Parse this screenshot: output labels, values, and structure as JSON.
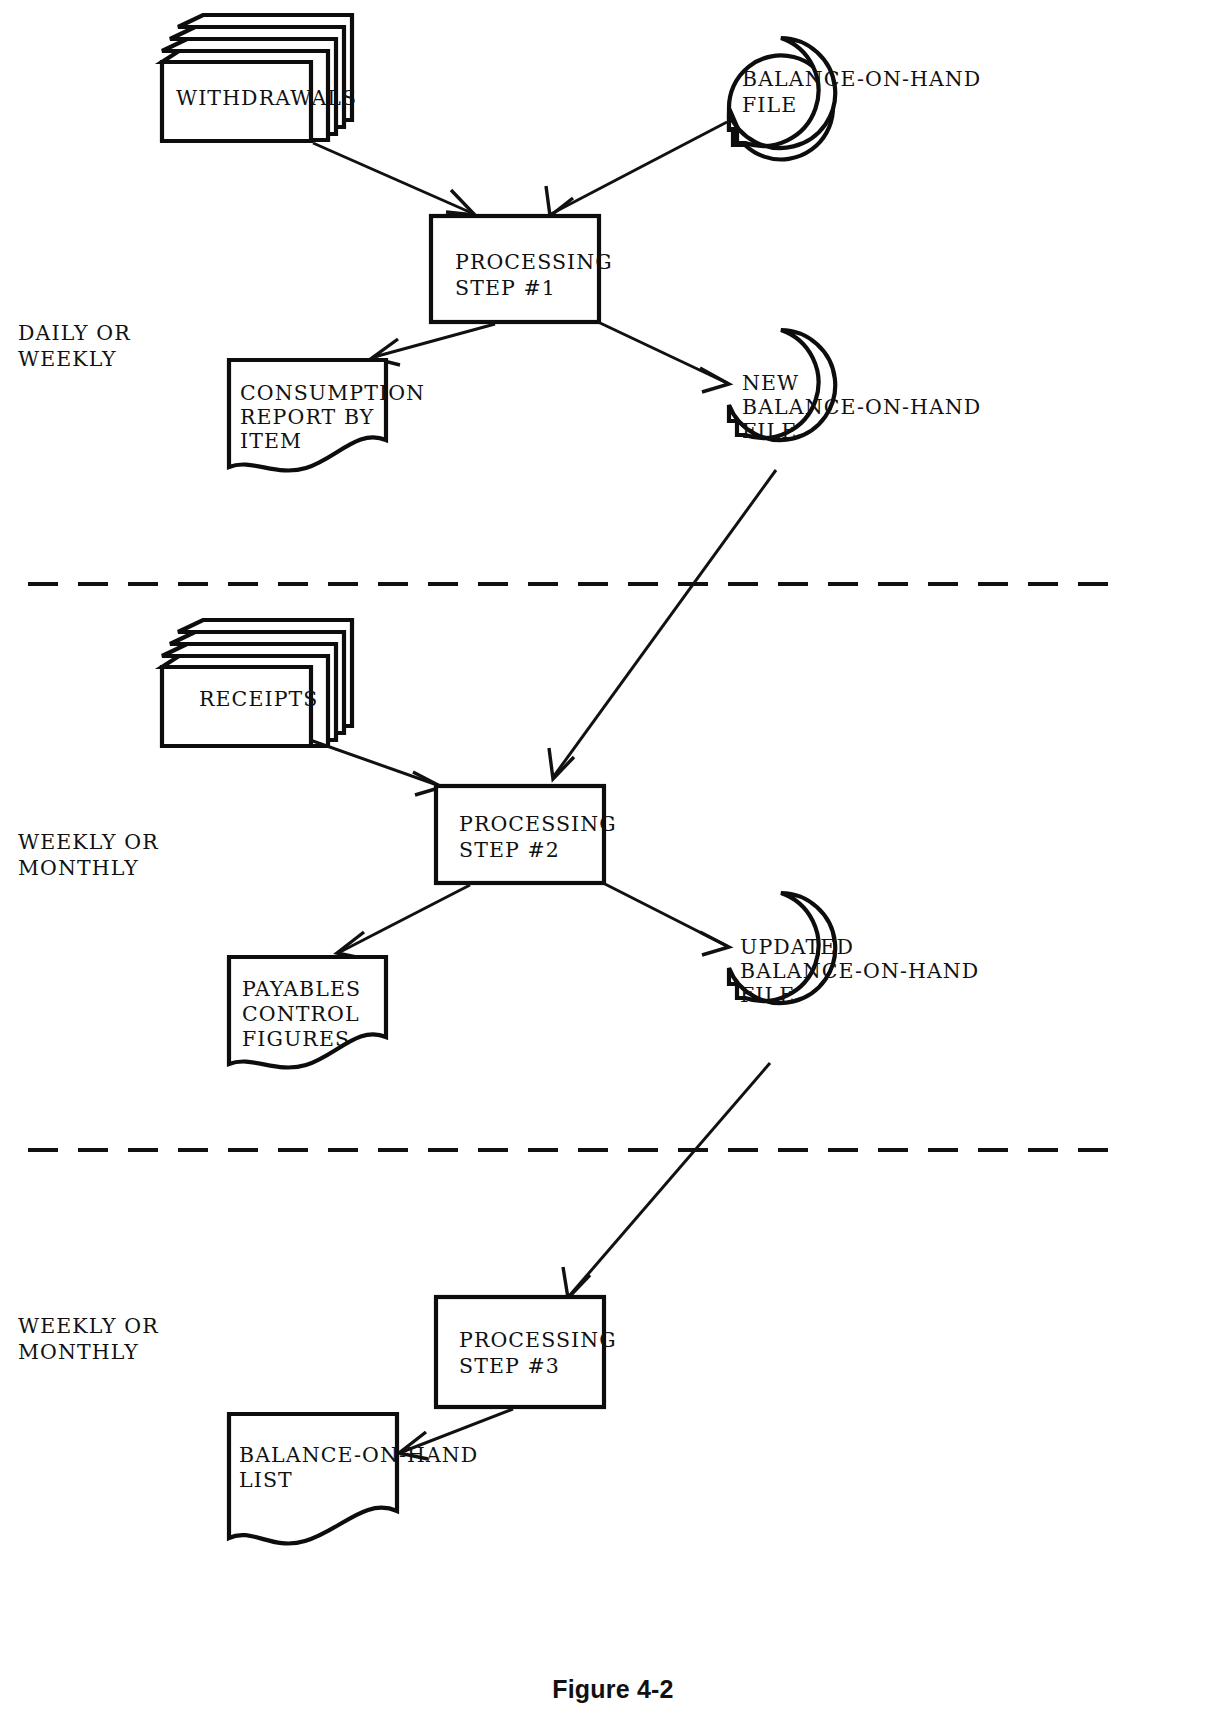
{
  "figure": {
    "caption": "Figure 4-2",
    "type": "system-flowchart",
    "ink_color": "#111111",
    "background_color": "#ffffff"
  },
  "phase_labels": [
    {
      "id": "phase-1",
      "line1": "DAILY OR",
      "line2": "WEEKLY"
    },
    {
      "id": "phase-2",
      "line1": "WEEKLY OR",
      "line2": "MONTHLY"
    },
    {
      "id": "phase-3",
      "line1": "WEEKLY OR",
      "line2": "MONTHLY"
    }
  ],
  "nodes": {
    "withdrawals": {
      "label": "WITHDRAWALS",
      "shape": "punched-card-deck"
    },
    "balance_on_hand_file": {
      "line1": "BALANCE-ON-HAND",
      "line2": "FILE",
      "shape": "magnetic-tape-file"
    },
    "processing_step_1": {
      "line1": "PROCESSING",
      "line2": "STEP #1",
      "shape": "process-box"
    },
    "consumption_report": {
      "line1": "CONSUMPTION",
      "line2": "REPORT BY",
      "line3": "ITEM",
      "shape": "document"
    },
    "new_balance_on_hand_file": {
      "line1": "NEW",
      "line2": "BALANCE-ON-HAND",
      "line3": "FILE",
      "shape": "magnetic-tape-file"
    },
    "receipts": {
      "label": "RECEIPTS",
      "shape": "punched-card-deck"
    },
    "processing_step_2": {
      "line1": "PROCESSING",
      "line2": "STEP #2",
      "shape": "process-box"
    },
    "payables_control": {
      "line1": "PAYABLES",
      "line2": "CONTROL",
      "line3": "FIGURES",
      "shape": "document"
    },
    "updated_balance_on_hand_file": {
      "line1": "UPDATED",
      "line2": "BALANCE-ON-HAND",
      "line3": "FILE",
      "shape": "magnetic-tape-file"
    },
    "processing_step_3": {
      "line1": "PROCESSING",
      "line2": "STEP #3",
      "shape": "process-box"
    },
    "balance_on_hand_list": {
      "line1": "BALANCE-ON-HAND",
      "line2": "LIST",
      "shape": "document"
    }
  },
  "edges": [
    {
      "from": "withdrawals",
      "to": "processing_step_1"
    },
    {
      "from": "balance_on_hand_file",
      "to": "processing_step_1"
    },
    {
      "from": "processing_step_1",
      "to": "consumption_report"
    },
    {
      "from": "processing_step_1",
      "to": "new_balance_on_hand_file"
    },
    {
      "from": "new_balance_on_hand_file",
      "to": "processing_step_2"
    },
    {
      "from": "receipts",
      "to": "processing_step_2"
    },
    {
      "from": "processing_step_2",
      "to": "payables_control"
    },
    {
      "from": "processing_step_2",
      "to": "updated_balance_on_hand_file"
    },
    {
      "from": "updated_balance_on_hand_file",
      "to": "processing_step_3"
    },
    {
      "from": "processing_step_3",
      "to": "balance_on_hand_list"
    }
  ],
  "dividers": [
    {
      "id": "divider-1",
      "y": 584
    },
    {
      "id": "divider-2",
      "y": 1150
    }
  ]
}
